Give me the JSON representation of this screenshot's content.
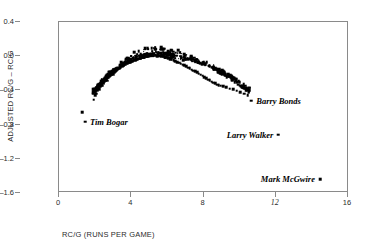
{
  "chart_data": {
    "type": "scatter",
    "title": "",
    "xlabel": "RC/G (RUNS PER GAME)",
    "ylabel": "ADJUSTED RC/G – RC/G",
    "xlim": [
      0,
      16
    ],
    "ylim": [
      -1.6,
      0.4
    ],
    "xticks": [
      {
        "value": 0,
        "label": "0",
        "emphasis": false
      },
      {
        "value": 4,
        "label": "4",
        "emphasis": false
      },
      {
        "value": 8,
        "label": "8",
        "emphasis": false
      },
      {
        "value": 12,
        "label": "12",
        "emphasis": true
      },
      {
        "value": 16,
        "label": "16",
        "emphasis": false
      }
    ],
    "yticks": [
      {
        "value": 0.4,
        "label": "0.4"
      },
      {
        "value": 0.0,
        "label": "0.0"
      },
      {
        "value": -0.4,
        "label": "-0.4"
      },
      {
        "value": -0.8,
        "label": "-0.8"
      },
      {
        "value": -1.2,
        "label": "-1.2"
      },
      {
        "value": -1.6,
        "label": "-1.6"
      }
    ],
    "grid": false,
    "legend": "none",
    "marker": "square",
    "marker_color": "#000000",
    "annotations": [
      {
        "text": "Tim Bogar",
        "x": 1.5,
        "y": -0.78,
        "side": "right"
      },
      {
        "text": "Barry Bonds",
        "x": 10.7,
        "y": -0.53,
        "side": "right"
      },
      {
        "text": "Larry Walker",
        "x": 12.2,
        "y": -0.93,
        "side": "left"
      },
      {
        "text": "Mark McGwire",
        "x": 14.5,
        "y": -1.45,
        "side": "left"
      }
    ],
    "labeled_points": [
      {
        "name": "Tim Bogar",
        "x": 1.5,
        "y": -0.78
      },
      {
        "name": "Barry Bonds",
        "x": 10.7,
        "y": -0.53
      },
      {
        "name": "Larry Walker",
        "x": 12.2,
        "y": -0.93
      },
      {
        "name": "Mark McGwire",
        "x": 14.5,
        "y": -1.45
      }
    ],
    "outlier_points": [
      {
        "x": 1.35,
        "y": -0.67
      }
    ],
    "cloud_description": "Dense inverted-parabola band of ~900 player seasons peaking near RC/G 5.3 at +0.02, sloping to -0.52 at RC/G 2 and thinning to -0.47 near RC/G 10.5",
    "cloud_fit": {
      "peak_x": 5.3,
      "peak_y": 0.02,
      "curvature": -0.0155
    },
    "cloud_x_range": [
      1.95,
      10.6
    ],
    "points": [
      {
        "x": 1.97,
        "y": -0.52
      },
      {
        "x": 2.05,
        "y": -0.47
      },
      {
        "x": 2.12,
        "y": -0.45
      },
      {
        "x": 2.2,
        "y": -0.41
      },
      {
        "x": 2.28,
        "y": -0.4
      },
      {
        "x": 2.33,
        "y": -0.37
      },
      {
        "x": 2.4,
        "y": -0.35
      },
      {
        "x": 2.45,
        "y": -0.355
      },
      {
        "x": 2.5,
        "y": -0.33
      },
      {
        "x": 2.55,
        "y": -0.31
      },
      {
        "x": 2.6,
        "y": -0.3
      },
      {
        "x": 2.63,
        "y": -0.285
      },
      {
        "x": 2.7,
        "y": -0.27
      },
      {
        "x": 2.74,
        "y": -0.3
      },
      {
        "x": 2.78,
        "y": -0.26
      },
      {
        "x": 2.85,
        "y": -0.25
      },
      {
        "x": 2.9,
        "y": -0.235
      },
      {
        "x": 2.95,
        "y": -0.22
      },
      {
        "x": 3.0,
        "y": -0.21
      },
      {
        "x": 3.05,
        "y": -0.225
      },
      {
        "x": 3.1,
        "y": -0.2
      },
      {
        "x": 3.15,
        "y": -0.19
      },
      {
        "x": 3.2,
        "y": -0.185
      },
      {
        "x": 3.25,
        "y": -0.175
      },
      {
        "x": 3.3,
        "y": -0.17
      },
      {
        "x": 3.32,
        "y": -0.155
      },
      {
        "x": 3.38,
        "y": -0.16
      },
      {
        "x": 3.42,
        "y": -0.145
      },
      {
        "x": 3.48,
        "y": -0.14
      },
      {
        "x": 3.5,
        "y": -0.125
      },
      {
        "x": 3.55,
        "y": -0.13
      },
      {
        "x": 3.6,
        "y": -0.12
      },
      {
        "x": 3.64,
        "y": -0.115
      },
      {
        "x": 3.7,
        "y": -0.11
      },
      {
        "x": 3.74,
        "y": -0.105
      },
      {
        "x": 3.8,
        "y": -0.1
      },
      {
        "x": 3.85,
        "y": -0.095
      },
      {
        "x": 3.9,
        "y": -0.09
      },
      {
        "x": 3.95,
        "y": -0.085
      },
      {
        "x": 4.0,
        "y": -0.08
      },
      {
        "x": 4.05,
        "y": -0.075
      },
      {
        "x": 4.1,
        "y": -0.07
      },
      {
        "x": 4.15,
        "y": -0.065
      },
      {
        "x": 4.2,
        "y": -0.06
      },
      {
        "x": 4.25,
        "y": -0.055
      },
      {
        "x": 4.3,
        "y": -0.05
      },
      {
        "x": 4.35,
        "y": -0.05
      },
      {
        "x": 4.4,
        "y": -0.045
      },
      {
        "x": 4.45,
        "y": -0.04
      },
      {
        "x": 4.5,
        "y": -0.04
      },
      {
        "x": 4.55,
        "y": -0.035
      },
      {
        "x": 4.6,
        "y": -0.03
      },
      {
        "x": 4.65,
        "y": -0.03
      },
      {
        "x": 4.7,
        "y": -0.025
      },
      {
        "x": 4.75,
        "y": -0.02
      },
      {
        "x": 4.8,
        "y": -0.02
      },
      {
        "x": 4.85,
        "y": -0.015
      },
      {
        "x": 4.9,
        "y": -0.015
      },
      {
        "x": 4.95,
        "y": -0.01
      },
      {
        "x": 5.0,
        "y": -0.01
      },
      {
        "x": 5.1,
        "y": -0.005
      },
      {
        "x": 5.2,
        "y": 0.0
      },
      {
        "x": 5.3,
        "y": 0.0
      },
      {
        "x": 5.4,
        "y": 0.0
      },
      {
        "x": 5.5,
        "y": -0.005
      },
      {
        "x": 5.6,
        "y": -0.005
      },
      {
        "x": 5.7,
        "y": -0.01
      },
      {
        "x": 5.8,
        "y": -0.015
      },
      {
        "x": 5.9,
        "y": -0.02
      },
      {
        "x": 6.0,
        "y": -0.03
      },
      {
        "x": 6.1,
        "y": -0.035
      },
      {
        "x": 6.2,
        "y": -0.045
      },
      {
        "x": 6.3,
        "y": -0.05
      },
      {
        "x": 6.4,
        "y": -0.06
      },
      {
        "x": 6.5,
        "y": -0.07
      },
      {
        "x": 6.6,
        "y": -0.08
      },
      {
        "x": 6.7,
        "y": -0.09
      },
      {
        "x": 6.8,
        "y": -0.1
      },
      {
        "x": 6.9,
        "y": -0.11
      },
      {
        "x": 7.0,
        "y": -0.12
      },
      {
        "x": 7.1,
        "y": -0.13
      },
      {
        "x": 7.2,
        "y": -0.145
      },
      {
        "x": 7.3,
        "y": -0.155
      },
      {
        "x": 7.4,
        "y": -0.17
      },
      {
        "x": 7.5,
        "y": -0.18
      },
      {
        "x": 7.6,
        "y": -0.19
      },
      {
        "x": 7.7,
        "y": -0.2
      },
      {
        "x": 7.8,
        "y": -0.215
      },
      {
        "x": 7.9,
        "y": -0.23
      },
      {
        "x": 8.0,
        "y": -0.24
      },
      {
        "x": 8.1,
        "y": -0.255
      },
      {
        "x": 8.2,
        "y": -0.27
      },
      {
        "x": 8.3,
        "y": -0.285
      },
      {
        "x": 8.4,
        "y": -0.295
      },
      {
        "x": 8.5,
        "y": -0.31
      },
      {
        "x": 8.6,
        "y": -0.32
      },
      {
        "x": 8.7,
        "y": -0.33
      },
      {
        "x": 8.8,
        "y": -0.345
      },
      {
        "x": 8.9,
        "y": -0.35
      },
      {
        "x": 9.0,
        "y": -0.355
      },
      {
        "x": 9.15,
        "y": -0.36
      },
      {
        "x": 9.3,
        "y": -0.375
      },
      {
        "x": 9.5,
        "y": -0.39
      },
      {
        "x": 9.7,
        "y": -0.4
      },
      {
        "x": 9.9,
        "y": -0.415
      },
      {
        "x": 10.1,
        "y": -0.43
      },
      {
        "x": 10.3,
        "y": -0.45
      },
      {
        "x": 10.5,
        "y": -0.465
      }
    ]
  }
}
